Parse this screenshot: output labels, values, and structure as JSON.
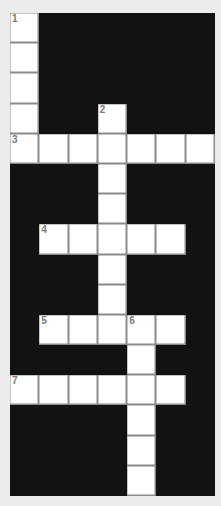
{
  "puzzle": {
    "type": "crossword",
    "rows": 16,
    "cols": 7,
    "colors": {
      "background": "#ececec",
      "block": "#121212",
      "cell": "#ffffff",
      "cell_border": "#8a8a8a",
      "number": "#7a7a7a"
    },
    "grid": [
      "W######",
      "W######",
      "W######",
      "W##W###",
      "WWWWWWW",
      "###W###",
      "###W###",
      "#WWWWW#",
      "###W###",
      "###W###",
      "#WWWWW#",
      "####W##",
      "WWWWWW#",
      "####W##",
      "####W##",
      "####W##"
    ],
    "numbers": [
      {
        "row": 0,
        "col": 0,
        "label": "1"
      },
      {
        "row": 3,
        "col": 3,
        "label": "2"
      },
      {
        "row": 4,
        "col": 0,
        "label": "3"
      },
      {
        "row": 7,
        "col": 1,
        "label": "4"
      },
      {
        "row": 10,
        "col": 1,
        "label": "5"
      },
      {
        "row": 10,
        "col": 4,
        "label": "6"
      },
      {
        "row": 12,
        "col": 0,
        "label": "7"
      }
    ],
    "entries": [
      {
        "number": "1",
        "direction": "down",
        "row": 0,
        "col": 0,
        "length": 5
      },
      {
        "number": "2",
        "direction": "down",
        "row": 3,
        "col": 3,
        "length": 8
      },
      {
        "number": "3",
        "direction": "across",
        "row": 4,
        "col": 0,
        "length": 7
      },
      {
        "number": "4",
        "direction": "across",
        "row": 7,
        "col": 1,
        "length": 5
      },
      {
        "number": "5",
        "direction": "across",
        "row": 10,
        "col": 1,
        "length": 5
      },
      {
        "number": "6",
        "direction": "down",
        "row": 10,
        "col": 4,
        "length": 6
      },
      {
        "number": "7",
        "direction": "across",
        "row": 12,
        "col": 0,
        "length": 6
      }
    ]
  }
}
